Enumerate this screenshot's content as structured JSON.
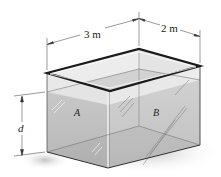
{
  "figure": {
    "dimensions": {
      "length_label": "3 m",
      "width_label": "2 m",
      "depth_label": "d"
    },
    "compartments": [
      {
        "label": "A"
      },
      {
        "label": "B"
      }
    ],
    "colors": {
      "rim": "#1a1a1a",
      "glass": "#e6e6e6",
      "liquid": "#b9b9b9",
      "shadow": "#cfcfcf",
      "dimension_line": "#333333"
    }
  }
}
